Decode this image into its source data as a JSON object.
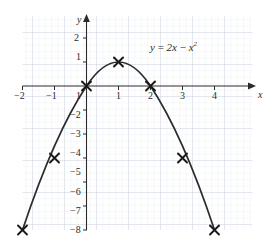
{
  "chart_data": {
    "type": "line",
    "title": "",
    "subtitle": "",
    "equation_label": "y = 2x − x²",
    "equation_parts": {
      "y": "y",
      "equals": "=",
      "coef_term": "2x",
      "minus": "−",
      "sq_base": "x",
      "sq_exp": "2"
    },
    "xlabel": "x",
    "ylabel": "y",
    "xlim": [
      -2.45,
      4.55
    ],
    "ylim": [
      -8.55,
      2.45
    ],
    "x_ticks": [
      -2,
      -1,
      1,
      2,
      3,
      4
    ],
    "x_tick_labels": [
      "−2",
      "−1",
      "1",
      "2",
      "3",
      "4"
    ],
    "y_ticks": [
      2,
      1,
      -1,
      -2,
      -3,
      -4,
      -5,
      -6,
      -7,
      -8
    ],
    "y_tick_labels": [
      "2",
      "1",
      "1",
      "−2",
      "−3",
      "−4",
      "−5",
      "−6",
      "−7",
      "−8"
    ],
    "grid": true,
    "grid_minor_divisions": 5,
    "legend": "none",
    "curve": {
      "name": "y = 2x - x^2",
      "x": [
        -2.0,
        -1.8,
        -1.6,
        -1.4,
        -1.2,
        -1.0,
        -0.8,
        -0.6,
        -0.4,
        -0.2,
        0.0,
        0.2,
        0.4,
        0.6,
        0.8,
        1.0,
        1.2,
        1.4,
        1.6,
        1.8,
        2.0,
        2.2,
        2.4,
        2.6,
        2.8,
        3.0,
        3.2,
        3.4,
        3.6,
        3.8,
        4.0
      ],
      "y": [
        -8.0,
        -6.84,
        -5.76,
        -4.76,
        -3.84,
        -3.0,
        -2.24,
        -1.56,
        -0.96,
        -0.44,
        0.0,
        0.36,
        0.64,
        0.84,
        0.96,
        1.0,
        0.96,
        0.84,
        0.64,
        0.36,
        0.0,
        -0.44,
        -0.96,
        -1.56,
        -2.24,
        -3.0,
        -3.84,
        -4.76,
        -5.76,
        -6.84,
        -8.0
      ]
    },
    "points": [
      {
        "x": -2,
        "y": -8,
        "marker": "cross"
      },
      {
        "x": -1,
        "y": -3,
        "marker": "cross"
      },
      {
        "x": 0,
        "y": 0,
        "marker": "cross"
      },
      {
        "x": 1,
        "y": 1,
        "marker": "cross"
      },
      {
        "x": 2,
        "y": 0,
        "marker": "cross"
      },
      {
        "x": 3,
        "y": -3,
        "marker": "cross"
      },
      {
        "x": 4,
        "y": -8,
        "marker": "cross"
      }
    ],
    "colors": {
      "curve": "#2b2b2b",
      "axis": "#2b2b2b",
      "grid_major": "#c8d0da",
      "grid_minor": "#e2e7ee",
      "background": "#ffffff",
      "text": "#2b2b2b"
    }
  }
}
